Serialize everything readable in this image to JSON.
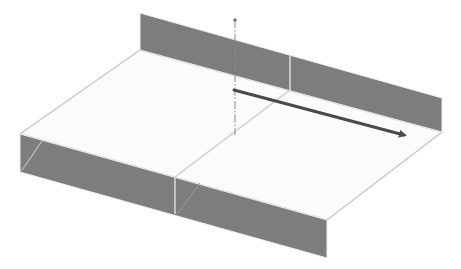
{
  "diagram": {
    "type": "3d-isometric-model",
    "colors": {
      "background": "#ffffff",
      "floor_fill": "#fbfbfb",
      "floor_edge": "#c8c8c8",
      "wall_fill": "#7d7d7d",
      "wall_edge_light": "#e6e6e6",
      "divider_line": "#d9d9d9",
      "axis_line": "#8a8a8a",
      "arrow": "#4a4a4a"
    },
    "floor": {
      "points": [
        [
          140,
          50
        ],
        [
          442,
          132
        ],
        [
          327,
          220
        ],
        [
          20,
          134
        ]
      ]
    },
    "floor_center_line": {
      "from": [
        290,
        90
      ],
      "to": [
        175,
        177
      ]
    },
    "back_wall": {
      "points": [
        [
          140,
          13
        ],
        [
          442,
          98
        ],
        [
          442,
          132
        ],
        [
          140,
          50
        ]
      ],
      "divider": {
        "x1": 290,
        "y1": 55,
        "x2": 290,
        "y2": 91
      }
    },
    "front_wall": {
      "points": [
        [
          20,
          134
        ],
        [
          327,
          220
        ],
        [
          327,
          258
        ],
        [
          20,
          172
        ]
      ],
      "divider": {
        "x1": 175,
        "y1": 177,
        "x2": 175,
        "y2": 214
      },
      "inner_diagonal": {
        "from": [
          42,
          141
        ],
        "to": [
          22,
          170
        ]
      },
      "inner_diagonal_2": {
        "from": [
          200,
          183
        ],
        "to": [
          178,
          213
        ]
      }
    },
    "axis": {
      "label": "vertical symmetry axis",
      "x": 235,
      "y_top": 20,
      "y_bottom": 135,
      "style": "dash-dot"
    },
    "arrow": {
      "label": "direction arrow",
      "from": [
        234,
        90
      ],
      "to": [
        404,
        135
      ]
    }
  }
}
